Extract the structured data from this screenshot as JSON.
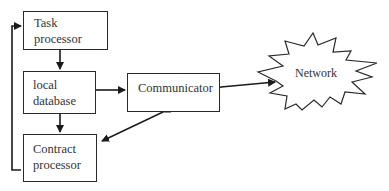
{
  "diagram": {
    "nodes": [
      {
        "id": "task",
        "label_line1": "Task",
        "label_line2": "processor"
      },
      {
        "id": "db",
        "label_line1": "local",
        "label_line2": "database"
      },
      {
        "id": "contract",
        "label_line1": "Contract",
        "label_line2": "processor"
      },
      {
        "id": "comm",
        "label": "Communicator"
      },
      {
        "id": "net",
        "label": "Network"
      }
    ],
    "edges": [
      {
        "from": "task",
        "to": "db",
        "direction": "both"
      },
      {
        "from": "db",
        "to": "contract",
        "direction": "both"
      },
      {
        "from": "db",
        "to": "comm",
        "direction": "both"
      },
      {
        "from": "comm",
        "to": "contract",
        "direction": "both"
      },
      {
        "from": "comm",
        "to": "net",
        "direction": "both"
      },
      {
        "from": "contract",
        "to": "task",
        "direction": "one-way",
        "route": "left loop"
      }
    ],
    "colors": {
      "stroke": "#2a2a2a",
      "text": "#333333",
      "background": "#ffffff"
    }
  }
}
